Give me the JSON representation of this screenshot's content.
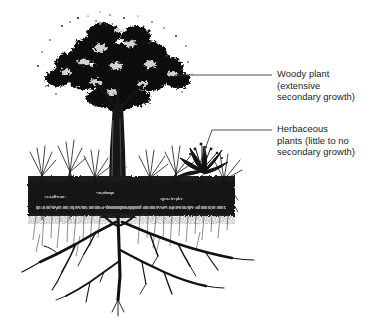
{
  "figure": {
    "kind": "botanical-line-illustration",
    "background_color": "#ffffff",
    "ink_color": "#111111",
    "leader_line_color": "#3b3b3b"
  },
  "labels": {
    "woody": {
      "text": "Woody plant\n(extensive\nsecondary growth)",
      "line1": "Woody plant",
      "line2": "(extensive",
      "line3": "secondary growth)"
    },
    "herbaceous": {
      "text": "Herbaceous\nplants (little to no\nsecondary growth)",
      "line1": "Herbaceous",
      "line2": "plants (little to no",
      "line3": "secondary growth)"
    }
  },
  "leaders": {
    "woody": {
      "from_x": 175,
      "from_y": 75,
      "to_x": 272,
      "to_y": 75
    },
    "herbaceous": {
      "from_x": 200,
      "from_y": 163,
      "corner_x": 212,
      "corner_y": 130,
      "to_x": 272,
      "to_y": 130
    }
  },
  "scene": {
    "soil_band": {
      "x": 28,
      "y": 178,
      "width": 207,
      "height": 38
    },
    "trunk": {
      "x": 118,
      "top_y": 110,
      "bottom_y": 218
    },
    "canopy": {
      "center_x": 118,
      "center_y": 62,
      "width": 128,
      "height": 96
    },
    "herb_tufts": [
      {
        "x": 42,
        "y": 172
      },
      {
        "x": 68,
        "y": 168
      },
      {
        "x": 92,
        "y": 176
      },
      {
        "x": 150,
        "y": 176
      },
      {
        "x": 176,
        "y": 172
      },
      {
        "x": 222,
        "y": 178
      }
    ],
    "rosette": {
      "x": 202,
      "y": 166
    }
  }
}
